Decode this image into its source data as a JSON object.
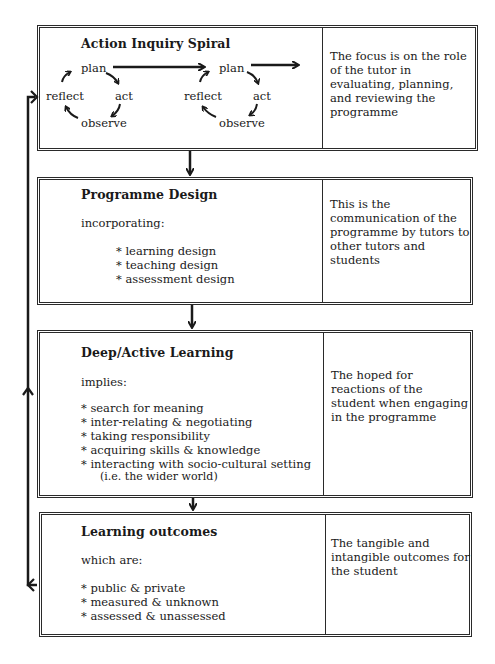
{
  "boxes": [
    {
      "title": "Action Inquiry Spiral",
      "cycles": [
        {
          "plan": "plan",
          "act": "act",
          "observe": "observe",
          "reflect": "reflect"
        },
        {
          "plan": "plan",
          "act": "act",
          "observe": "observe",
          "reflect": "reflect"
        }
      ],
      "description": "The focus is on the role of the tutor in evaluating, planning, and reviewing the programme"
    },
    {
      "title": "Programme Design",
      "intro": "incorporating:",
      "items": [
        "* learning design",
        "* teaching design",
        "* assessment design"
      ],
      "description": "This is the communication of the programme by tutors to other tutors and students"
    },
    {
      "title": "Deep/Active Learning",
      "intro": "implies:",
      "items": [
        "* search for meaning",
        "* inter-relating & negotiating",
        "* taking responsibility",
        "* acquiring skills & knowledge",
        "* interacting with socio-cultural setting"
      ],
      "note": "(i.e. the wider world)",
      "description": "The hoped for reactions of the student when engaging in the programme"
    },
    {
      "title": "Learning outcomes",
      "intro": "which are:",
      "items": [
        "* public & private",
        "* measured & unknown",
        "* assessed & unassessed"
      ],
      "description": "The tangible and intangible outcomes for the student"
    }
  ]
}
